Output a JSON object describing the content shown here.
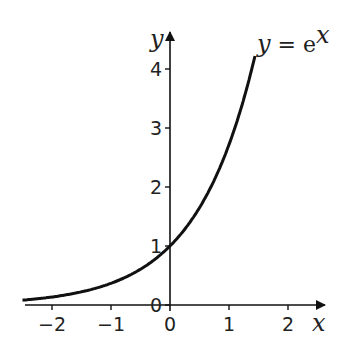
{
  "chart_data": {
    "type": "line",
    "title": "",
    "xlabel": "x",
    "ylabel": "y",
    "xlim": [
      -2.5,
      2.5
    ],
    "ylim": [
      0,
      4.5
    ],
    "grid": false,
    "x_ticks": [
      "-2",
      "-1",
      "0",
      "1",
      "2"
    ],
    "y_ticks": [
      "0",
      "1",
      "2",
      "3",
      "4"
    ],
    "series": [
      {
        "name": "y = e^x",
        "function": "exp(x)",
        "x": [
          -2.5,
          -2,
          -1.5,
          -1,
          -0.5,
          0,
          0.5,
          1,
          1.25,
          1.45
        ],
        "values": [
          0.08,
          0.14,
          0.22,
          0.37,
          0.61,
          1,
          1.65,
          2.72,
          3.49,
          4.26
        ]
      }
    ],
    "annotations": [
      {
        "text_y": "y",
        "text_eq": " = e",
        "text_sup": "x"
      }
    ]
  }
}
